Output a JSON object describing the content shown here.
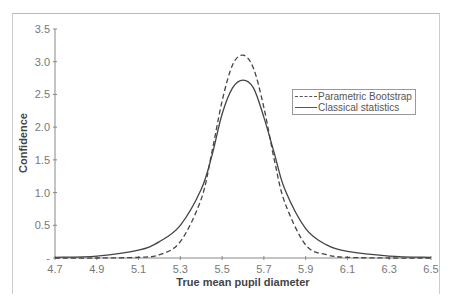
{
  "chart_data": {
    "type": "line",
    "title": "",
    "xlabel": "True mean pupil diameter",
    "ylabel": "Confidence",
    "xlim": [
      4.7,
      6.5
    ],
    "ylim": [
      0,
      3.5
    ],
    "x_ticks": [
      "4.7",
      "4.9",
      "5.1",
      "5.3",
      "5.5",
      "5.7",
      "5.9",
      "6.1",
      "6.3",
      "6.5"
    ],
    "y_ticks": [
      "-",
      "0.5",
      "1.0",
      "1.5",
      "2.0",
      "2.5",
      "3.0",
      "3.5"
    ],
    "grid": false,
    "legend_position": "right-upper",
    "series": [
      {
        "name": "Parametric Bootstrap",
        "style": "dashed",
        "x": [
          4.7,
          4.9,
          5.1,
          5.2,
          5.3,
          5.4,
          5.45,
          5.5,
          5.55,
          5.6,
          5.65,
          5.7,
          5.75,
          5.8,
          5.9,
          6.0,
          6.1,
          6.3,
          6.5
        ],
        "values": [
          0.0,
          0.0,
          0.01,
          0.05,
          0.25,
          0.9,
          1.6,
          2.4,
          2.95,
          3.1,
          2.9,
          2.3,
          1.5,
          0.85,
          0.2,
          0.05,
          0.01,
          0.0,
          0.0
        ]
      },
      {
        "name": "Classical statistics",
        "style": "solid",
        "x": [
          4.7,
          4.9,
          5.1,
          5.2,
          5.3,
          5.4,
          5.45,
          5.5,
          5.55,
          5.6,
          5.65,
          5.7,
          5.75,
          5.8,
          5.9,
          6.0,
          6.1,
          6.3,
          6.5
        ],
        "values": [
          0.01,
          0.03,
          0.12,
          0.25,
          0.5,
          1.05,
          1.55,
          2.2,
          2.6,
          2.72,
          2.6,
          2.15,
          1.6,
          1.05,
          0.45,
          0.2,
          0.1,
          0.03,
          0.01
        ]
      }
    ]
  },
  "legend": {
    "items": [
      {
        "label": "Parametric Bootstrap"
      },
      {
        "label": "Classical statistics"
      }
    ]
  }
}
